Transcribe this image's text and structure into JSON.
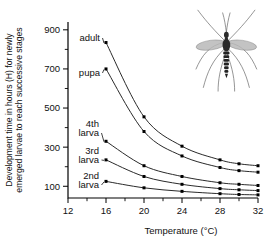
{
  "chart_data": {
    "type": "line",
    "title": "",
    "xlabel": "Temperature (°C)",
    "ylabel": "Development time in hours (H) for newly emerged larvae to reach successive stages",
    "ylabel_line1": "Development time in hours (H) for newly",
    "ylabel_line2": "emerged larvae to reach successive stages",
    "x": [
      16,
      20,
      24,
      28,
      30,
      32
    ],
    "xlim": [
      12,
      32
    ],
    "ylim": [
      40,
      940
    ],
    "xticks": [
      12,
      16,
      20,
      24,
      28,
      32
    ],
    "xticks_minor": [
      14,
      18,
      22,
      26,
      30
    ],
    "yticks": [
      100,
      300,
      500,
      700,
      900
    ],
    "yticks_minor": [
      200,
      400,
      600,
      800
    ],
    "grid": false,
    "legend_position": "inline-left-annotations",
    "series": [
      {
        "name": "adult",
        "label_line1": "adult",
        "label_line2": "",
        "values": [
          835,
          455,
          305,
          235,
          215,
          205
        ]
      },
      {
        "name": "pupa",
        "label_line1": "pupa",
        "label_line2": "",
        "values": [
          700,
          380,
          255,
          196,
          180,
          172
        ]
      },
      {
        "name": "4th larva",
        "label_line1": "4th",
        "label_line2": "larva",
        "values": [
          330,
          205,
          150,
          118,
          110,
          104
        ]
      },
      {
        "name": "3rd larva",
        "label_line1": "3rd",
        "label_line2": "larva",
        "values": [
          235,
          150,
          110,
          88,
          82,
          78
        ]
      },
      {
        "name": "2nd larva",
        "label_line1": "2nd",
        "label_line2": "larva",
        "values": [
          125,
          92,
          74,
          62,
          58,
          56
        ]
      }
    ],
    "annotations": [
      "adult",
      "pupa",
      "4th larva",
      "3rd larva",
      "2nd larva"
    ],
    "illustration": "mosquito-illustration"
  },
  "figure": {
    "xaxis_title": "Temperature (°C)",
    "yaxis_title_line1": "Development time in hours (H) for newly",
    "yaxis_title_line2": "emerged larvae to reach successive stages",
    "xtick_labels": [
      "12",
      "16",
      "20",
      "24",
      "28",
      "32"
    ],
    "ytick_labels": [
      "100",
      "300",
      "500",
      "700",
      "900"
    ],
    "series_labels": [
      {
        "l1": "adult",
        "l2": ""
      },
      {
        "l1": "pupa",
        "l2": ""
      },
      {
        "l1": "4th",
        "l2": "larva"
      },
      {
        "l1": "3rd",
        "l2": "larva"
      },
      {
        "l1": "2nd",
        "l2": "larva"
      }
    ],
    "colors": {
      "ink": "#111111",
      "curve": "#2a2a2a",
      "background": "#ffffff"
    }
  }
}
